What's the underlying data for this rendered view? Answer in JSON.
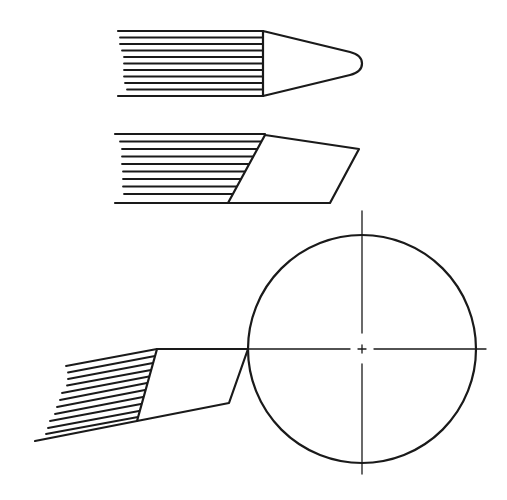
{
  "figure": {
    "type": "technical-line-drawing",
    "background": "#ffffff",
    "ink_color": "#1a1a1a",
    "elements": [
      {
        "id": "pointed-tip",
        "description": "Hatched stem with conical tip ending in rounded point",
        "hatch_lines": 11
      },
      {
        "id": "chisel-tip",
        "description": "Hatched stem with slanted chisel-cut tip",
        "hatch_lines": 10
      },
      {
        "id": "angled-chisel-tip",
        "description": "Tilted hatched stem with chisel tip touching circle",
        "hatch_lines": 11
      },
      {
        "id": "circle",
        "description": "Circle with dashed center lines",
        "center": [
          362,
          349
        ],
        "radius": 114
      }
    ]
  }
}
